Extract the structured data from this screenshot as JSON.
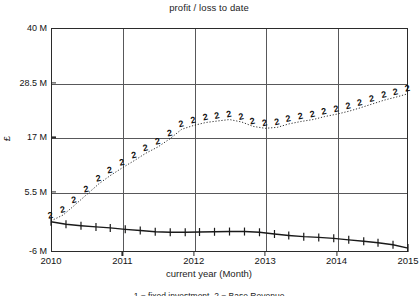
{
  "chart_data": {
    "type": "line",
    "title": "profit / loss to date",
    "xlabel": "current year (Month)",
    "ylabel": "£",
    "xlim": [
      2010,
      2015
    ],
    "ylim": [
      -6000000,
      40000000
    ],
    "grid": true,
    "legend_position": "bottom",
    "ytick_labels": [
      "40 M",
      "28.5 M",
      "17 M",
      "5.5 M",
      "-6 M"
    ],
    "ytick_values": [
      40000000,
      28500000,
      17000000,
      5500000,
      -6000000
    ],
    "xtick_labels": [
      "2010",
      "2011",
      "2012",
      "2013",
      "2014",
      "2015"
    ],
    "xtick_values": [
      2010,
      2011,
      2012,
      2013,
      2014,
      2015
    ],
    "series": [
      {
        "name": "1",
        "marker": "1",
        "style": "solid",
        "color": "#1a1a1a",
        "x": [
          2010.0,
          2010.21,
          2010.42,
          2010.63,
          2010.83,
          2011.04,
          2011.25,
          2011.46,
          2011.67,
          2011.88,
          2012.08,
          2012.29,
          2012.5,
          2012.71,
          2012.92,
          2013.13,
          2013.33,
          2013.54,
          2013.75,
          2013.96,
          2014.17,
          2014.38,
          2014.58,
          2014.79,
          2015.0
        ],
        "values": [
          0.2,
          -0.3,
          -0.6,
          -0.85,
          -1.05,
          -1.35,
          -1.6,
          -1.85,
          -1.95,
          -1.95,
          -1.9,
          -1.85,
          -1.8,
          -1.8,
          -1.95,
          -2.3,
          -2.6,
          -2.85,
          -3.0,
          -3.2,
          -3.5,
          -3.8,
          -4.1,
          -4.5,
          -5.2
        ],
        "value_unit": "millions of £"
      },
      {
        "name": "2",
        "marker": "2",
        "style": "dotted",
        "color": "#1a1a1a",
        "x": [
          2010.0,
          2010.17,
          2010.33,
          2010.5,
          2010.67,
          2010.83,
          2011.0,
          2011.17,
          2011.33,
          2011.5,
          2011.67,
          2011.83,
          2012.0,
          2012.17,
          2012.33,
          2012.5,
          2012.67,
          2012.83,
          2013.0,
          2013.17,
          2013.33,
          2013.5,
          2013.67,
          2013.83,
          2014.0,
          2014.17,
          2014.33,
          2014.5,
          2014.67,
          2014.83,
          2015.0
        ],
        "values": [
          0.4,
          1.6,
          3.6,
          5.8,
          8.0,
          9.7,
          11.3,
          12.8,
          14.3,
          15.6,
          17.3,
          19.2,
          20.0,
          20.6,
          20.9,
          21.2,
          20.7,
          19.8,
          19.4,
          19.6,
          20.3,
          20.8,
          21.2,
          21.8,
          22.3,
          22.9,
          23.6,
          24.4,
          25.2,
          25.8,
          26.5
        ],
        "value_unit": "millions of £"
      }
    ],
    "legend_caption": "1 = fixed investment, 2 = Base Revenue"
  }
}
